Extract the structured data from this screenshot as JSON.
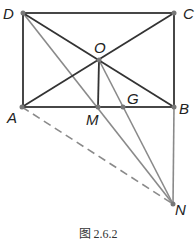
{
  "figure": {
    "caption": "图 2.6.2",
    "points": {
      "D": {
        "label": "D",
        "x": 23,
        "y": 13
      },
      "C": {
        "label": "C",
        "x": 174,
        "y": 13
      },
      "A": {
        "label": "A",
        "x": 22,
        "y": 107
      },
      "B": {
        "label": "B",
        "x": 174,
        "y": 107
      },
      "O": {
        "label": "O",
        "x": 99,
        "y": 60
      },
      "M": {
        "label": "M",
        "x": 98,
        "y": 107
      },
      "G": {
        "label": "G",
        "x": 123,
        "y": 107
      },
      "N": {
        "label": "N",
        "x": 173,
        "y": 204
      }
    },
    "segments": [
      {
        "from": "D",
        "to": "C",
        "style": "solid",
        "color": "#333333"
      },
      {
        "from": "C",
        "to": "B",
        "style": "solid",
        "color": "#333333"
      },
      {
        "from": "B",
        "to": "A",
        "style": "solid",
        "color": "#333333"
      },
      {
        "from": "A",
        "to": "D",
        "style": "solid",
        "color": "#333333"
      },
      {
        "from": "A",
        "to": "C",
        "style": "solid",
        "color": "#333333"
      },
      {
        "from": "D",
        "to": "B",
        "style": "solid",
        "color": "#333333"
      },
      {
        "from": "O",
        "to": "M",
        "style": "solid",
        "color": "#333333"
      },
      {
        "from": "D",
        "to": "N",
        "style": "solid",
        "color": "#888888"
      },
      {
        "from": "O",
        "to": "N",
        "style": "solid",
        "color": "#888888"
      },
      {
        "from": "B",
        "to": "N",
        "style": "solid",
        "color": "#888888"
      },
      {
        "from": "A",
        "to": "N",
        "style": "dashed",
        "color": "#888888"
      }
    ]
  }
}
